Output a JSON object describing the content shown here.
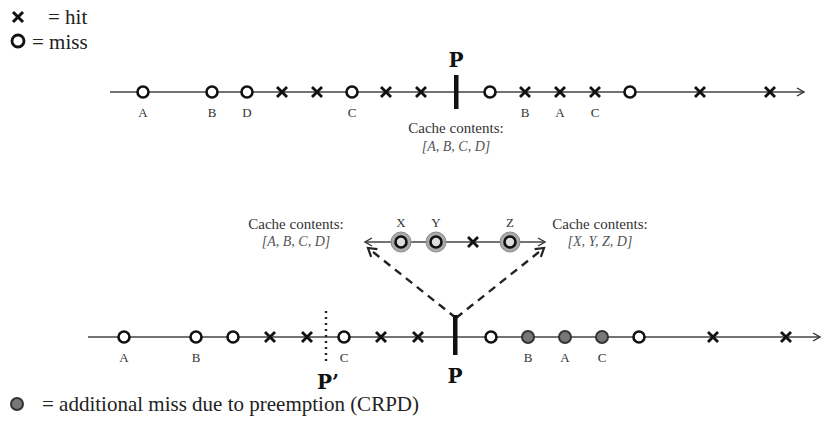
{
  "legend": {
    "hit_label": "= hit",
    "miss_label": "= miss",
    "crpd_label": "= additional miss due to preemption (CRPD)"
  },
  "top_timeline": {
    "preemption_label": "P",
    "cache_title": "Cache contents:",
    "cache_set": "[A, B, C, D]",
    "events": [
      {
        "x": 143,
        "type": "miss",
        "label": "A"
      },
      {
        "x": 212,
        "type": "miss",
        "label": "B"
      },
      {
        "x": 247,
        "type": "miss",
        "label": "D"
      },
      {
        "x": 282,
        "type": "hit",
        "label": ""
      },
      {
        "x": 317,
        "type": "hit",
        "label": ""
      },
      {
        "x": 352,
        "type": "miss",
        "label": "C"
      },
      {
        "x": 386,
        "type": "hit",
        "label": ""
      },
      {
        "x": 421,
        "type": "hit",
        "label": ""
      },
      {
        "x": 490,
        "type": "miss",
        "label": ""
      },
      {
        "x": 525,
        "type": "hit",
        "label": "B"
      },
      {
        "x": 560,
        "type": "hit",
        "label": "A"
      },
      {
        "x": 595,
        "type": "hit",
        "label": "C"
      },
      {
        "x": 630,
        "type": "miss",
        "label": ""
      },
      {
        "x": 700,
        "type": "hit",
        "label": ""
      },
      {
        "x": 770,
        "type": "hit",
        "label": ""
      }
    ]
  },
  "preempting_task": {
    "left_cache_title": "Cache contents:",
    "left_cache_set": "[A, B, C, D]",
    "right_cache_title": "Cache contents:",
    "right_cache_set": "[X, Y, Z, D]",
    "events": [
      {
        "x": 401,
        "type": "miss-highlight",
        "label": "X"
      },
      {
        "x": 436,
        "type": "miss-highlight",
        "label": "Y"
      },
      {
        "x": 473,
        "type": "hit",
        "label": ""
      },
      {
        "x": 510,
        "type": "miss-highlight",
        "label": "Z"
      }
    ]
  },
  "bottom_timeline": {
    "preemption_label": "P",
    "alt_preemption_label": "P’",
    "events": [
      {
        "x": 124,
        "type": "miss",
        "label": "A"
      },
      {
        "x": 196,
        "type": "miss",
        "label": "B"
      },
      {
        "x": 233,
        "type": "miss",
        "label": ""
      },
      {
        "x": 270,
        "type": "hit",
        "label": ""
      },
      {
        "x": 307,
        "type": "hit",
        "label": ""
      },
      {
        "x": 344,
        "type": "miss",
        "label": "C"
      },
      {
        "x": 381,
        "type": "hit",
        "label": ""
      },
      {
        "x": 418,
        "type": "hit",
        "label": ""
      },
      {
        "x": 491,
        "type": "miss",
        "label": ""
      },
      {
        "x": 528,
        "type": "crpd",
        "label": "B"
      },
      {
        "x": 565,
        "type": "crpd",
        "label": "A"
      },
      {
        "x": 602,
        "type": "crpd",
        "label": "C"
      },
      {
        "x": 639,
        "type": "miss",
        "label": ""
      },
      {
        "x": 713,
        "type": "hit",
        "label": ""
      },
      {
        "x": 786,
        "type": "hit",
        "label": ""
      }
    ]
  },
  "colors": {
    "line": "#333333",
    "marker": "#111111",
    "crpd_fill": "#777777",
    "highlight_ring": "#999999"
  }
}
